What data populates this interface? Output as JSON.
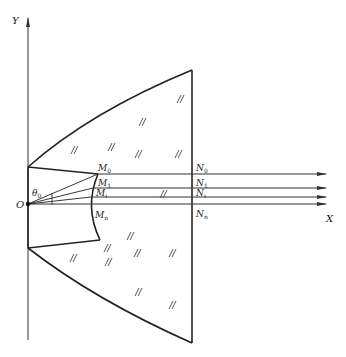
{
  "axes": {
    "x_label": "X",
    "y_label": "Y",
    "origin_label": "O"
  },
  "angle": {
    "symbol": "θ",
    "subscript": "0"
  },
  "points": [
    {
      "name": "M",
      "sub": "0"
    },
    {
      "name": "M",
      "sub": "1"
    },
    {
      "name": "M",
      "sub": "i"
    },
    {
      "name": "M",
      "sub": "n"
    },
    {
      "name": "N",
      "sub": "0"
    },
    {
      "name": "N",
      "sub": "1"
    },
    {
      "name": "N",
      "sub": "i"
    },
    {
      "name": "N",
      "sub": "n"
    }
  ],
  "hatch_mark": "//",
  "colors": {
    "line": "#222222",
    "axis": "#555555"
  }
}
